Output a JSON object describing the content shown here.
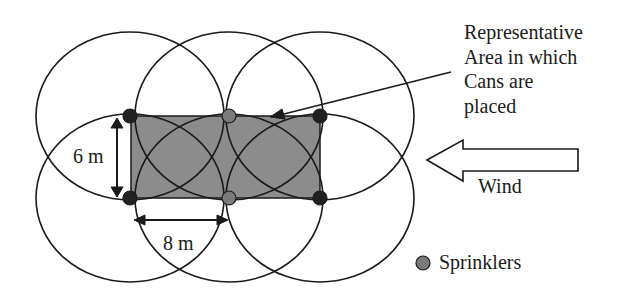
{
  "diagram": {
    "annotation": [
      "Representative",
      "Area in which",
      "Cans are",
      "placed"
    ],
    "dimension_vertical": "6 m",
    "dimension_horizontal": "8 m",
    "wind_label": "Wind",
    "legend_label": "Sprinklers",
    "colors": {
      "area_fill": "#8c8c8c",
      "sprinkler_fill": "#2a2a2a",
      "sprinkler_mid_fill": "#7a7a7a",
      "line": "#1a1a1a"
    },
    "sprinklers": [
      {
        "x": 130,
        "y": 116
      },
      {
        "x": 229,
        "y": 116
      },
      {
        "x": 320,
        "y": 116
      },
      {
        "x": 130,
        "y": 198
      },
      {
        "x": 229,
        "y": 198
      },
      {
        "x": 320,
        "y": 198
      }
    ]
  }
}
